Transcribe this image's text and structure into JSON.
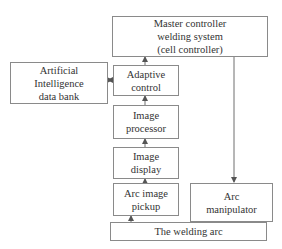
{
  "diagram": {
    "type": "block-diagram",
    "nodes": {
      "master": {
        "lines": [
          "Master controller",
          "welding system",
          "(cell controller)"
        ]
      },
      "ai": {
        "lines": [
          "Artificial",
          "Intelligence",
          "data bank"
        ]
      },
      "adaptive": {
        "lines": [
          "Adaptive",
          "control"
        ]
      },
      "processor": {
        "lines": [
          "Image",
          "processor"
        ]
      },
      "display": {
        "lines": [
          "Image",
          "display"
        ]
      },
      "pickup": {
        "lines": [
          "Arc image",
          "pickup"
        ]
      },
      "manipulator": {
        "lines": [
          "Arc",
          "manipulator"
        ]
      },
      "arc": {
        "lines": [
          "The welding arc"
        ]
      }
    },
    "edges": [
      {
        "from": "arc",
        "to": "pickup"
      },
      {
        "from": "pickup",
        "to": "display"
      },
      {
        "from": "display",
        "to": "processor"
      },
      {
        "from": "processor",
        "to": "adaptive"
      },
      {
        "from": "adaptive",
        "to": "master"
      },
      {
        "from": "ai",
        "to": "adaptive",
        "bidirectional": true
      },
      {
        "from": "master",
        "to": "manipulator"
      },
      {
        "from": "manipulator",
        "to": "arc"
      }
    ],
    "colors": {
      "line": "#6e6e6e",
      "border": "#8a8a8a",
      "text": "#333333"
    }
  }
}
